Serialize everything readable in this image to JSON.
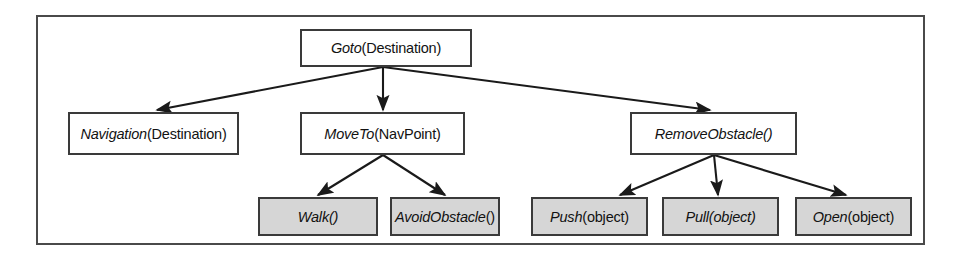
{
  "diagram": {
    "type": "task-decomposition-tree",
    "frame": {
      "border_color": "#4a4a4a"
    },
    "colors": {
      "node_fill": "#ffffff",
      "leaf_fill": "#d6d6d6",
      "node_border": "#3a3a3a",
      "arrow": "#1a1a1a",
      "text": "#121212"
    },
    "nodes": [
      {
        "id": "goto",
        "level": 0,
        "italic_part": "Goto",
        "plain_part": "(Destination)",
        "full_label": "Goto(Destination)",
        "leaf": false,
        "x": 300,
        "y": 29,
        "w": 172,
        "h": 38
      },
      {
        "id": "navigation",
        "level": 1,
        "italic_part": "Navigation",
        "plain_part": "(Destination)",
        "full_label": "Navigation(Destination)",
        "leaf": false,
        "x": 68,
        "y": 112,
        "w": 171,
        "h": 43
      },
      {
        "id": "moveto",
        "level": 1,
        "italic_part": "MoveTo",
        "plain_part": "(NavPoint)",
        "full_label": "MoveTo(NavPoint)",
        "leaf": false,
        "x": 300,
        "y": 112,
        "w": 165,
        "h": 43
      },
      {
        "id": "removeobstacle",
        "level": 1,
        "italic_part": "RemoveObstacle()",
        "plain_part": "",
        "full_label": "RemoveObstacle()",
        "leaf": false,
        "x": 630,
        "y": 112,
        "w": 167,
        "h": 43
      },
      {
        "id": "walk",
        "level": 2,
        "italic_part": "Walk()",
        "plain_part": "",
        "full_label": "Walk()",
        "leaf": true,
        "x": 258,
        "y": 197,
        "w": 120,
        "h": 39
      },
      {
        "id": "avoidobstacle",
        "level": 2,
        "italic_part": "AvoidObstacle",
        "plain_part": "()",
        "full_label": "AvoidObstacle()",
        "leaf": true,
        "x": 390,
        "y": 197,
        "w": 110,
        "h": 39
      },
      {
        "id": "push",
        "level": 2,
        "italic_part": "Push",
        "plain_part": "(object)",
        "full_label": "Push(object)",
        "leaf": true,
        "x": 531,
        "y": 197,
        "w": 117,
        "h": 39
      },
      {
        "id": "pull",
        "level": 2,
        "italic_part": "Pull(object)",
        "plain_part": "",
        "full_label": "Pull(object)",
        "leaf": true,
        "x": 662,
        "y": 197,
        "w": 117,
        "h": 39
      },
      {
        "id": "open",
        "level": 2,
        "italic_part": "Open",
        "plain_part": "(object)",
        "full_label": "Open(object)",
        "leaf": true,
        "x": 795,
        "y": 197,
        "w": 117,
        "h": 39
      }
    ],
    "edges": [
      {
        "from": "goto",
        "to": "navigation"
      },
      {
        "from": "goto",
        "to": "moveto"
      },
      {
        "from": "goto",
        "to": "removeobstacle"
      },
      {
        "from": "moveto",
        "to": "walk"
      },
      {
        "from": "moveto",
        "to": "avoidobstacle"
      },
      {
        "from": "removeobstacle",
        "to": "push"
      },
      {
        "from": "removeobstacle",
        "to": "pull"
      },
      {
        "from": "removeobstacle",
        "to": "open"
      }
    ]
  }
}
